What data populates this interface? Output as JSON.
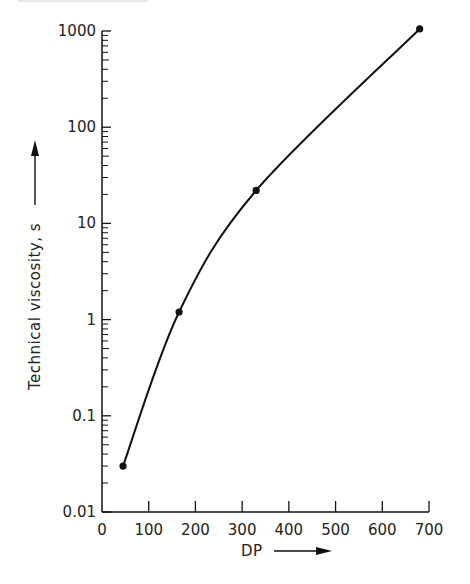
{
  "chart_data": {
    "type": "line",
    "title": "",
    "xlabel": "DP",
    "ylabel": "Technical viscosity, s",
    "xscale": "linear",
    "yscale": "log",
    "xlim": [
      0,
      700
    ],
    "ylim": [
      0.01,
      1000
    ],
    "x_ticks": [
      0,
      100,
      200,
      300,
      400,
      500,
      600,
      700
    ],
    "x_tick_labels": [
      "0",
      "100",
      "200",
      "300",
      "400",
      "500",
      "600",
      "700"
    ],
    "y_ticks": [
      0.01,
      0.1,
      1,
      10,
      100,
      1000
    ],
    "y_tick_labels": [
      "0.01",
      "0.1",
      "1",
      "10",
      "100",
      "1000"
    ],
    "grid": false,
    "legend": null,
    "series": [
      {
        "name": "Technical viscosity vs DP",
        "x": [
          45,
          165,
          330,
          680
        ],
        "y": [
          0.03,
          1.2,
          22,
          1050
        ],
        "markers": true,
        "smooth_curve": true
      }
    ]
  },
  "labels": {
    "x_axis": "DP",
    "y_axis": "Technical viscosity, s"
  },
  "colors": {
    "ink": "#111111",
    "background": "#ffffff"
  }
}
